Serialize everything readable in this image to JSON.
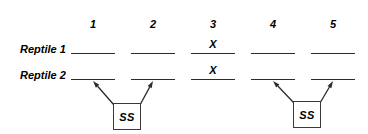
{
  "figure": {
    "background_color": "#ffffff",
    "ink_color": "#2b2b2b"
  },
  "columns": {
    "headers": [
      "1",
      "2",
      "3",
      "4",
      "5"
    ],
    "x_positions": [
      93,
      153,
      213,
      273,
      333
    ],
    "header_y": 18
  },
  "rows": [
    {
      "label": "Reptile 1",
      "label_x": 20,
      "label_y": 43,
      "line_y": 53,
      "marks": [
        "",
        "",
        "X",
        "",
        ""
      ],
      "mark_y": 38
    },
    {
      "label": "Reptile 2",
      "label_x": 20,
      "label_y": 69,
      "line_y": 79,
      "marks": [
        "",
        "",
        "X",
        "",
        ""
      ],
      "mark_y": 64
    }
  ],
  "line_geometry": {
    "half_width": 22,
    "thickness": 1.6
  },
  "ss_boxes": [
    {
      "label": "SS",
      "x": 113,
      "y": 103,
      "width": 28,
      "height": 27,
      "targets": [
        93,
        153
      ]
    },
    {
      "label": "SS",
      "x": 293,
      "y": 101,
      "width": 28,
      "height": 27,
      "targets": [
        273,
        333
      ]
    }
  ],
  "arrows": {
    "color": "#2b2b2b",
    "stroke_width": 1.3,
    "head_length": 7,
    "head_width": 4.5,
    "target_y_offset": 2
  }
}
